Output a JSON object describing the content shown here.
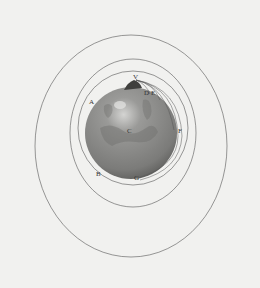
{
  "figure": {
    "labels": {
      "V": "V",
      "D": "D",
      "E": "E",
      "A": "A",
      "C": "C",
      "F": "F",
      "B": "B",
      "G": "G"
    },
    "colors": {
      "background": "#f1f1ef",
      "line": "#555555",
      "globe": "#8a8a88",
      "globe_dark": "#5e5e5c",
      "highlight": "#d6d6d4"
    }
  }
}
